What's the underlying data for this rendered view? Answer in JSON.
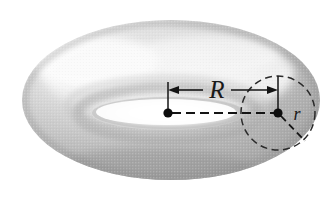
{
  "figure": {
    "type": "geometry-diagram",
    "background_color": "#ffffff",
    "width": 336,
    "height": 213,
    "labels": {
      "major_radius": "R",
      "minor_radius": "r"
    },
    "annotations": {
      "major_radius_description": "R",
      "minor_radius_description": "r"
    },
    "colors": {
      "surface_light": "#f2f2f2",
      "surface_mid": "#c9c9c9",
      "surface_dark": "#9a9a9a",
      "surface_shadow": "#8a8a8a",
      "hole_fill": "#ffffff",
      "ink": "#141414"
    },
    "geometry": {
      "torus_center_x": 168,
      "torus_center_y": 113,
      "tube_center_x": 278,
      "tube_center_y": 113,
      "tube_circle_radius": 37,
      "outer_ellipse_rx": 150,
      "outer_ellipse_ry": 78,
      "hole_ellipse_rx": 76,
      "hole_ellipse_ry": 16
    },
    "elements": {
      "torus_surface_name": "torus-surface",
      "torus_hole_name": "torus-hole",
      "dimension_arrow_name": "major-radius-dimension",
      "tube_circle_name": "tube-cross-section-circle",
      "center_dot_name": "torus-center-dot",
      "tube_dot_name": "tube-center-dot",
      "axis_name": "center-axis-dashed-line",
      "radius_segment_name": "minor-radius-segment"
    }
  }
}
